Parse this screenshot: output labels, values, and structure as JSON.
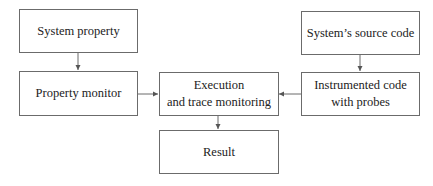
{
  "diagram": {
    "nodes": [
      {
        "id": "system-property",
        "lines": [
          "System property"
        ]
      },
      {
        "id": "property-monitor",
        "lines": [
          "Property monitor"
        ]
      },
      {
        "id": "execution",
        "lines": [
          "Execution",
          "and trace monitoring"
        ]
      },
      {
        "id": "source-code",
        "lines": [
          "System’s source code"
        ]
      },
      {
        "id": "instrumented-code",
        "lines": [
          "Instrumented code",
          "with probes"
        ]
      },
      {
        "id": "result",
        "lines": [
          "Result"
        ]
      }
    ],
    "edges": [
      {
        "from": "system-property",
        "to": "property-monitor"
      },
      {
        "from": "property-monitor",
        "to": "execution"
      },
      {
        "from": "source-code",
        "to": "instrumented-code"
      },
      {
        "from": "instrumented-code",
        "to": "execution"
      },
      {
        "from": "execution",
        "to": "result"
      }
    ],
    "colors": {
      "stroke": "#6b6b6b",
      "text": "#222222",
      "background": "#ffffff"
    }
  }
}
